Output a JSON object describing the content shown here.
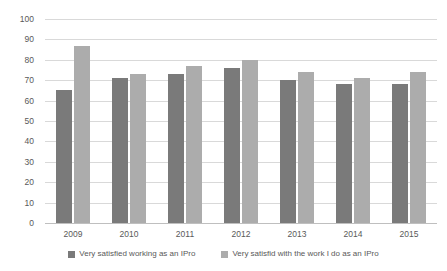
{
  "chart_data": {
    "type": "bar",
    "title": "",
    "subtitle": "",
    "xlabel": "",
    "ylabel": "",
    "ylim": [
      0,
      100
    ],
    "ytick_step": 10,
    "ytick_labels": [
      "100",
      "90",
      "80",
      "70",
      "60",
      "50",
      "40",
      "30",
      "20",
      "10",
      "0"
    ],
    "grid": true,
    "legend_position": "bottom",
    "categories": [
      "2009",
      "2010",
      "2011",
      "2012",
      "2013",
      "2014",
      "2015"
    ],
    "series": [
      {
        "name": "Very satisfied working as an IPro",
        "color": "#7a7a7a",
        "values": [
          65,
          71,
          73,
          76,
          70,
          68,
          68
        ]
      },
      {
        "name": "Very satisfid with the work I do as an IPro",
        "color": "#acacac",
        "values": [
          87,
          73,
          77,
          80,
          74,
          71,
          74
        ]
      }
    ]
  },
  "colors": {
    "series_dark": "#7a7a7a",
    "series_light": "#acacac",
    "gridline": "#d9d9d9",
    "axis": "#bfbfbf",
    "text": "#595959",
    "background": "#ffffff"
  }
}
